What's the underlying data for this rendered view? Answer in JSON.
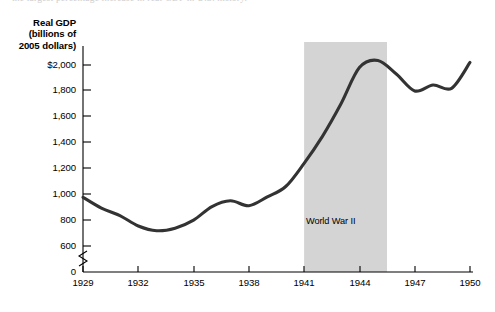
{
  "caption_clip": "the largest percentage increase in real GDP in U.S. history.",
  "chart_data": {
    "type": "line",
    "title": "",
    "xlabel": "",
    "ylabel": "Real GDP (billions of 2005 dollars)",
    "ylabel_lines": [
      "Real GDP",
      "(billions of",
      "2005 dollars)"
    ],
    "x": [
      1929,
      1930,
      1931,
      1932,
      1933,
      1934,
      1935,
      1936,
      1937,
      1938,
      1939,
      1940,
      1941,
      1942,
      1943,
      1944,
      1945,
      1946,
      1947,
      1948,
      1949,
      1950
    ],
    "values": [
      977,
      893,
      835,
      755,
      718,
      738,
      800,
      905,
      950,
      912,
      980,
      1060,
      1240,
      1450,
      1700,
      1980,
      2035,
      1930,
      1800,
      1845,
      1820,
      2020
    ],
    "series": [
      {
        "name": "Real GDP",
        "values": [
          977,
          893,
          835,
          755,
          718,
          738,
          800,
          905,
          950,
          912,
          980,
          1060,
          1240,
          1450,
          1700,
          1980,
          2035,
          1930,
          1800,
          1845,
          1820,
          2020
        ]
      }
    ],
    "x_ticks": [
      1929,
      1932,
      1935,
      1938,
      1941,
      1944,
      1947,
      1950
    ],
    "x_tick_labels": [
      "1929",
      "1932",
      "1935",
      "1938",
      "1941",
      "1944",
      "1947",
      "1950"
    ],
    "y_ticks": [
      0,
      600,
      800,
      1000,
      1200,
      1400,
      1600,
      1800,
      2000
    ],
    "y_tick_labels": [
      "0",
      "600",
      "800",
      "1,000",
      "1,200",
      "1,400",
      "1,600",
      "1,800",
      "$2,000"
    ],
    "xlim": [
      1929,
      1950
    ],
    "ylim": [
      600,
      2100
    ],
    "y_axis_break": true,
    "y_axis_break_between": [
      0,
      600
    ],
    "grid": false,
    "legend": null,
    "line_color": "#333333",
    "annotations": [
      {
        "text": "World War II",
        "type": "shaded-band",
        "x_start": 1941,
        "x_end": 1945.5,
        "band_color": "#d4d4d4"
      }
    ]
  }
}
